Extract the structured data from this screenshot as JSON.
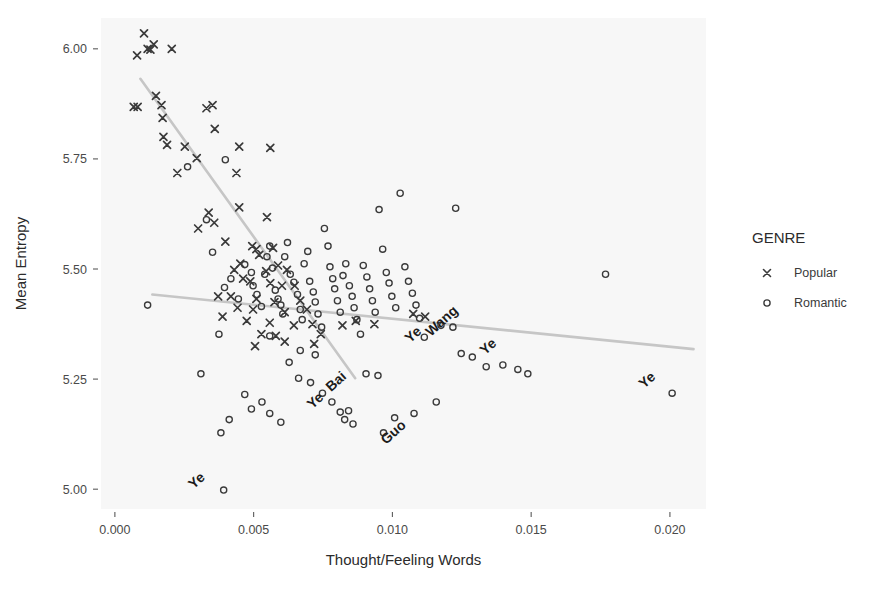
{
  "chart_data": {
    "type": "scatter",
    "title": "",
    "xlabel": "Thought/Feeling Words",
    "ylabel": "Mean Entropy",
    "xlim": [
      -0.0005,
      0.0213
    ],
    "ylim": [
      4.955,
      6.07
    ],
    "xticks": [
      0.0,
      0.005,
      0.01,
      0.015,
      0.02
    ],
    "xticklabels": [
      "0.000",
      "0.005",
      "0.010",
      "0.015",
      "0.020"
    ],
    "yticks": [
      5.0,
      5.25,
      5.5,
      5.75,
      6.0
    ],
    "yticklabels": [
      "5.00",
      "5.25",
      "5.50",
      "5.75",
      "6.00"
    ],
    "grid": false,
    "panel_background": "#f7f7f7",
    "legend": {
      "title": "GENRE",
      "position": "right",
      "entries": [
        {
          "name": "Popular",
          "marker": "x",
          "color": "#3a3a3a"
        },
        {
          "name": "Romantic",
          "marker": "o",
          "color": "#3a3a3a"
        }
      ]
    },
    "series": [
      {
        "name": "Popular",
        "marker": "x",
        "color": "#3a3a3a",
        "points": [
          [
            0.00105,
            6.035
          ],
          [
            0.0008,
            5.985
          ],
          [
            0.0014,
            6.01
          ],
          [
            0.00128,
            5.998
          ],
          [
            0.00118,
            6.0
          ],
          [
            0.00205,
            6.0
          ],
          [
            0.00068,
            5.868
          ],
          [
            0.00082,
            5.868
          ],
          [
            0.00148,
            5.893
          ],
          [
            0.00168,
            5.872
          ],
          [
            0.00172,
            5.843
          ],
          [
            0.0033,
            5.865
          ],
          [
            0.00352,
            5.872
          ],
          [
            0.00175,
            5.8
          ],
          [
            0.00188,
            5.782
          ],
          [
            0.0036,
            5.818
          ],
          [
            0.00252,
            5.778
          ],
          [
            0.00448,
            5.778
          ],
          [
            0.00295,
            5.752
          ],
          [
            0.00225,
            5.718
          ],
          [
            0.00438,
            5.718
          ],
          [
            0.0056,
            5.775
          ],
          [
            0.00338,
            5.628
          ],
          [
            0.00358,
            5.605
          ],
          [
            0.003,
            5.592
          ],
          [
            0.00448,
            5.64
          ],
          [
            0.00548,
            5.618
          ],
          [
            0.00398,
            5.562
          ],
          [
            0.0057,
            5.548
          ],
          [
            0.00495,
            5.552
          ],
          [
            0.0051,
            5.545
          ],
          [
            0.0052,
            5.532
          ],
          [
            0.00452,
            5.512
          ],
          [
            0.0043,
            5.498
          ],
          [
            0.00588,
            5.508
          ],
          [
            0.00545,
            5.495
          ],
          [
            0.0062,
            5.498
          ],
          [
            0.00462,
            5.478
          ],
          [
            0.00488,
            5.472
          ],
          [
            0.0056,
            5.468
          ],
          [
            0.00602,
            5.462
          ],
          [
            0.00648,
            5.462
          ],
          [
            0.00372,
            5.438
          ],
          [
            0.00418,
            5.438
          ],
          [
            0.0051,
            5.432
          ],
          [
            0.00575,
            5.425
          ],
          [
            0.00668,
            5.428
          ],
          [
            0.00442,
            5.412
          ],
          [
            0.00498,
            5.408
          ],
          [
            0.00612,
            5.402
          ],
          [
            0.00692,
            5.408
          ],
          [
            0.00388,
            5.392
          ],
          [
            0.00475,
            5.382
          ],
          [
            0.00558,
            5.378
          ],
          [
            0.00645,
            5.372
          ],
          [
            0.00712,
            5.375
          ],
          [
            0.00528,
            5.352
          ],
          [
            0.0058,
            5.348
          ],
          [
            0.00742,
            5.352
          ],
          [
            0.0082,
            5.372
          ],
          [
            0.00868,
            5.382
          ],
          [
            0.00935,
            5.375
          ],
          [
            0.01075,
            5.398
          ],
          [
            0.01118,
            5.392
          ],
          [
            0.00612,
            5.335
          ],
          [
            0.00718,
            5.33
          ],
          [
            0.00505,
            5.325
          ]
        ]
      },
      {
        "name": "Romantic",
        "marker": "o",
        "color": "#3a3a3a",
        "points": [
          [
            0.00118,
            5.418
          ],
          [
            0.0031,
            5.262
          ],
          [
            0.0033,
            5.612
          ],
          [
            0.00352,
            5.538
          ],
          [
            0.00395,
            5.458
          ],
          [
            0.00418,
            5.478
          ],
          [
            0.00262,
            5.732
          ],
          [
            0.00398,
            5.748
          ],
          [
            0.00445,
            5.432
          ],
          [
            0.00468,
            5.51
          ],
          [
            0.00492,
            5.492
          ],
          [
            0.00498,
            5.462
          ],
          [
            0.00512,
            5.442
          ],
          [
            0.00528,
            5.415
          ],
          [
            0.0054,
            5.488
          ],
          [
            0.00548,
            5.528
          ],
          [
            0.00558,
            5.552
          ],
          [
            0.00568,
            5.502
          ],
          [
            0.00578,
            5.452
          ],
          [
            0.00588,
            5.432
          ],
          [
            0.00598,
            5.418
          ],
          [
            0.00605,
            5.398
          ],
          [
            0.00612,
            5.528
          ],
          [
            0.00622,
            5.56
          ],
          [
            0.00632,
            5.488
          ],
          [
            0.00645,
            5.47
          ],
          [
            0.00658,
            5.442
          ],
          [
            0.00668,
            5.408
          ],
          [
            0.00675,
            5.385
          ],
          [
            0.00682,
            5.512
          ],
          [
            0.00695,
            5.54
          ],
          [
            0.00702,
            5.472
          ],
          [
            0.00715,
            5.448
          ],
          [
            0.00722,
            5.425
          ],
          [
            0.00732,
            5.398
          ],
          [
            0.00745,
            5.368
          ],
          [
            0.00755,
            5.592
          ],
          [
            0.00768,
            5.552
          ],
          [
            0.00775,
            5.505
          ],
          [
            0.00785,
            5.478
          ],
          [
            0.00792,
            5.455
          ],
          [
            0.00802,
            5.428
          ],
          [
            0.00812,
            5.402
          ],
          [
            0.00822,
            5.485
          ],
          [
            0.00832,
            5.512
          ],
          [
            0.00845,
            5.462
          ],
          [
            0.00855,
            5.438
          ],
          [
            0.00862,
            5.412
          ],
          [
            0.00872,
            5.385
          ],
          [
            0.00885,
            5.352
          ],
          [
            0.00895,
            5.508
          ],
          [
            0.00908,
            5.482
          ],
          [
            0.00918,
            5.455
          ],
          [
            0.00928,
            5.428
          ],
          [
            0.00938,
            5.402
          ],
          [
            0.00952,
            5.635
          ],
          [
            0.00965,
            5.545
          ],
          [
            0.00978,
            5.492
          ],
          [
            0.00988,
            5.468
          ],
          [
            0.00998,
            5.438
          ],
          [
            0.01012,
            5.412
          ],
          [
            0.01028,
            5.672
          ],
          [
            0.01045,
            5.505
          ],
          [
            0.01058,
            5.472
          ],
          [
            0.01072,
            5.445
          ],
          [
            0.01085,
            5.418
          ],
          [
            0.01098,
            5.388
          ],
          [
            0.01115,
            5.345
          ],
          [
            0.00628,
            5.288
          ],
          [
            0.00662,
            5.252
          ],
          [
            0.00705,
            5.242
          ],
          [
            0.00748,
            5.218
          ],
          [
            0.00782,
            5.198
          ],
          [
            0.00812,
            5.175
          ],
          [
            0.00828,
            5.158
          ],
          [
            0.00842,
            5.178
          ],
          [
            0.00858,
            5.148
          ],
          [
            0.00468,
            5.215
          ],
          [
            0.00492,
            5.182
          ],
          [
            0.0053,
            5.198
          ],
          [
            0.00558,
            5.172
          ],
          [
            0.00598,
            5.152
          ],
          [
            0.00905,
            5.262
          ],
          [
            0.00948,
            5.258
          ],
          [
            0.00668,
            5.315
          ],
          [
            0.00722,
            5.305
          ],
          [
            0.00558,
            5.348
          ],
          [
            0.00375,
            5.352
          ],
          [
            0.01175,
            5.372
          ],
          [
            0.01218,
            5.368
          ],
          [
            0.01248,
            5.308
          ],
          [
            0.01288,
            5.3
          ],
          [
            0.01338,
            5.278
          ],
          [
            0.01398,
            5.282
          ],
          [
            0.01452,
            5.272
          ],
          [
            0.01488,
            5.262
          ],
          [
            0.01768,
            5.488
          ],
          [
            0.01228,
            5.638
          ],
          [
            0.02008,
            5.218
          ],
          [
            0.00392,
            4.998
          ],
          [
            0.01008,
            5.162
          ],
          [
            0.01078,
            5.172
          ],
          [
            0.00382,
            5.128
          ],
          [
            0.00412,
            5.158
          ],
          [
            0.01158,
            5.198
          ],
          [
            0.00968,
            5.128
          ]
        ]
      }
    ],
    "trend_lines": [
      {
        "series": "Popular",
        "color": "#c6c6c6",
        "x0": 0.00092,
        "y0": 5.932,
        "x1": 0.00866,
        "y1": 5.252
      },
      {
        "series": "Romantic",
        "color": "#c6c6c6",
        "x0": 0.00135,
        "y0": 5.442,
        "x1": 0.02085,
        "y1": 5.318
      }
    ],
    "point_labels": [
      {
        "text": "Ye",
        "x": 0.00392,
        "y": 4.998,
        "rotation": -42,
        "dx": -24,
        "dy": -6
      },
      {
        "text": "Ye",
        "x": 0.00812,
        "y": 5.175,
        "rotation": -42,
        "dx": -22,
        "dy": -8
      },
      {
        "text": "Bai",
        "x": 0.00858,
        "y": 5.205,
        "rotation": -42,
        "dx": -14,
        "dy": -14
      },
      {
        "text": "Guo",
        "x": 0.01072,
        "y": 5.108,
        "rotation": -42,
        "dx": -16,
        "dy": -6
      },
      {
        "text": "Ye",
        "x": 0.01165,
        "y": 5.325,
        "rotation": -42,
        "dx": -22,
        "dy": -8
      },
      {
        "text": "Wang",
        "x": 0.01232,
        "y": 5.338,
        "rotation": -42,
        "dx": -12,
        "dy": -16
      },
      {
        "text": "Ye",
        "x": 0.01428,
        "y": 5.298,
        "rotation": -42,
        "dx": -20,
        "dy": -8
      },
      {
        "text": "Ye",
        "x": 0.02008,
        "y": 5.222,
        "rotation": -42,
        "dx": -22,
        "dy": -8
      }
    ]
  }
}
